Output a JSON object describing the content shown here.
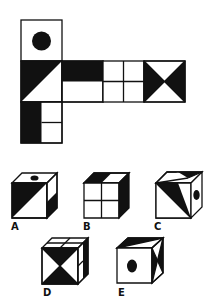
{
  "puzzle": {
    "type": "cube-net",
    "question_visible": false,
    "colors": {
      "ink": "#111111",
      "paper": "#ffffff"
    },
    "net": {
      "faces": [
        {
          "id": "top-circle",
          "pattern": "black circle centered"
        },
        {
          "id": "diagonal-left",
          "pattern": "diagonal split, black upper-left triangle"
        },
        {
          "id": "half-black",
          "pattern": "top half black, bottom half white"
        },
        {
          "id": "four-squares",
          "pattern": "2x2 white grid"
        },
        {
          "id": "bowtie",
          "pattern": "black left and right triangles meeting at center"
        },
        {
          "id": "bottom-stripe",
          "pattern": "left half black, right half split into 2 white squares"
        }
      ]
    },
    "options": [
      {
        "label": "A"
      },
      {
        "label": "B"
      },
      {
        "label": "C"
      },
      {
        "label": "D"
      },
      {
        "label": "E"
      }
    ]
  }
}
